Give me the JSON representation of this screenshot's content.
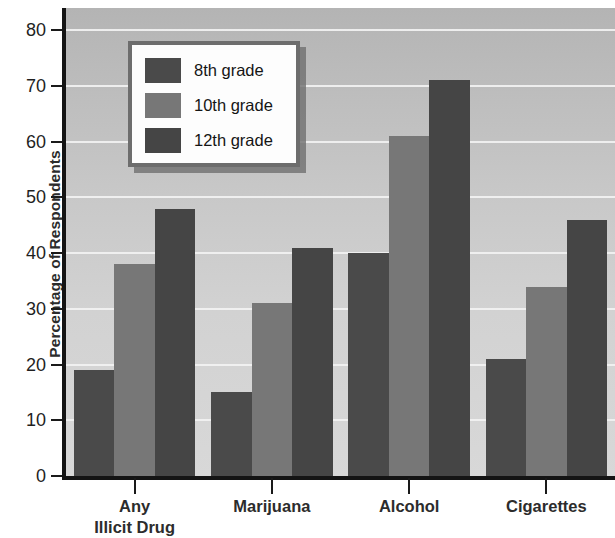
{
  "chart_data": {
    "type": "bar",
    "title": "",
    "subtitle": "",
    "xlabel": "",
    "ylabel": "Percentage of Respondents",
    "categories": [
      "Any\nIllicit Drug",
      "Marijuana",
      "Alcohol",
      "Cigarettes"
    ],
    "category_labels_flat": [
      "Any Illicit Drug",
      "Marijuana",
      "Alcohol",
      "Cigarettes"
    ],
    "series": [
      {
        "name": "8th grade",
        "values": [
          19,
          15,
          40,
          21
        ],
        "color": "#4a4a4a"
      },
      {
        "name": "10th grade",
        "values": [
          38,
          31,
          61,
          34
        ],
        "color": "#777777"
      },
      {
        "name": "12th grade",
        "values": [
          48,
          41,
          71,
          46
        ],
        "color": "#454545"
      }
    ],
    "ylim": [
      0,
      84
    ],
    "yticks": [
      0,
      10,
      20,
      30,
      40,
      50,
      60,
      70,
      80
    ],
    "ytick_labels": [
      "0",
      "10",
      "20",
      "30",
      "40",
      "50",
      "60",
      "70",
      "80"
    ],
    "grid": true,
    "grid_axis": "y",
    "legend_position": "upper-left-inside",
    "plot_background": "gray-gradient",
    "bar_group_gap": true
  },
  "legend": {
    "entries": [
      {
        "label": "8th grade"
      },
      {
        "label": "10th grade"
      },
      {
        "label": "12th grade"
      }
    ]
  },
  "axis": {
    "y_title": "Percentage of Respondents"
  }
}
